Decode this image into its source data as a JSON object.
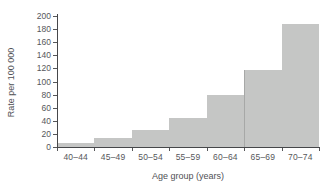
{
  "figure": {
    "background": "#ffffff",
    "bar_color": "#c5c6c5",
    "axis_color": "#46474a",
    "label_color": "#56575b"
  },
  "chart_data": {
    "type": "bar",
    "title": "",
    "categories": [
      "40–44",
      "45–49",
      "50–54",
      "55–59",
      "60–64",
      "65–69",
      "70–74"
    ],
    "values": [
      6,
      13,
      26,
      44,
      80,
      118,
      188
    ],
    "xlabel": "Age group (years)",
    "ylabel": "Rate per 100 000",
    "ylim": [
      0,
      200
    ],
    "ytick_step": 20,
    "yticks": [
      0,
      20,
      40,
      60,
      80,
      100,
      120,
      140,
      160,
      180,
      200
    ],
    "grid": false,
    "legend": "none",
    "bar_gap": 0
  }
}
